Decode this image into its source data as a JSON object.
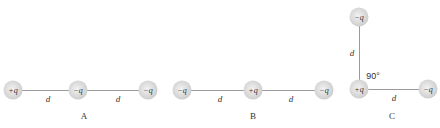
{
  "configurations": {
    "A": {
      "label": "A",
      "charges": [
        "+q",
        "−q",
        "−q"
      ],
      "distances": [
        "d",
        "d"
      ]
    },
    "B": {
      "label": "B",
      "charges": [
        "−q",
        "+q",
        "−q"
      ],
      "distances": [
        "d",
        "d"
      ]
    },
    "C": {
      "label": "C",
      "charges": [
        "−q",
        "+q",
        "−q"
      ],
      "distances": [
        "d",
        "d"
      ],
      "angle": "90°"
    }
  }
}
